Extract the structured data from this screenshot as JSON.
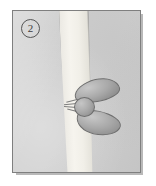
{
  "figure": {
    "panel_label": "2",
    "caption_text": "",
    "frame_border_color": "#7f7f7f",
    "background_color": "#cfcfcf",
    "page_background_color": "#ffffff",
    "shadow_color": "#b9b9b9"
  },
  "illustration": {
    "type": "biological-schematic",
    "band": {
      "name": "vertical-pale-band",
      "orientation": "vertical",
      "tilt_degrees": -2.2,
      "fill_color": "#f4f2ec",
      "edge_color": "#949494"
    },
    "bodies": [
      {
        "name": "upper-oval-body",
        "shape": "ellipse",
        "position": "upper-right-of-band",
        "rotation_degrees": -13,
        "fill_color": "#a9a9a9",
        "outline_color": "#6e6e6e"
      },
      {
        "name": "round-body",
        "shape": "circle",
        "position": "middle-left-of-band",
        "rotation_degrees": 0,
        "fill_color": "#ababab",
        "outline_color": "#6e6e6e"
      },
      {
        "name": "lower-oval-body",
        "shape": "ellipse",
        "position": "lower-right-of-band",
        "rotation_degrees": 12,
        "fill_color": "#a9a9a9",
        "outline_color": "#6e6e6e"
      }
    ],
    "whiskers": {
      "name": "radiating-lines",
      "count": 4,
      "side": "left-of-round-body",
      "color": "#7d7d7d"
    }
  }
}
